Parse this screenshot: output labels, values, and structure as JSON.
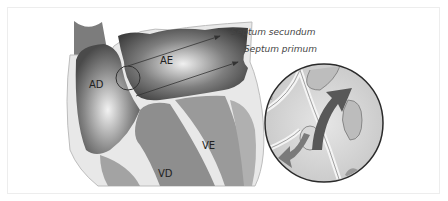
{
  "diagram": {
    "chambers": {
      "right_atrium": "AD",
      "left_atrium": "AE",
      "right_ventricle": "VD",
      "left_ventricle": "VE"
    },
    "callouts": [
      {
        "label": "Septum secundum"
      },
      {
        "label": "Septum primum"
      }
    ],
    "inset": {
      "description": "magnified view of foramen ovale with shunt flow arrows"
    },
    "colors": {
      "background": "#ffffff",
      "frame": "#ededed",
      "chamber_dark": "#5a5a5a",
      "chamber_light": "#d8d8d8",
      "muscle": "#8c8c8c",
      "wall": "#e6e6e6",
      "arrow": "#333333"
    }
  }
}
